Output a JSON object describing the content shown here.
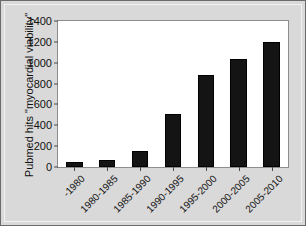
{
  "chart_data": {
    "type": "bar",
    "title": "",
    "xlabel": "",
    "ylabel": "Pubmed hits \"myocardial viability\"",
    "categories": [
      "-1980",
      "1980-1985",
      "1985-1990",
      "1990-1995",
      "1995-2000",
      "2000-2005",
      "2005-2010"
    ],
    "values": [
      50,
      70,
      150,
      510,
      880,
      1040,
      1200
    ],
    "ylim": [
      0,
      1400
    ],
    "ytick_labels": [
      "0",
      "200",
      "400",
      "600",
      "800",
      "1000",
      "1200",
      "1400"
    ],
    "ytick_values": [
      0,
      200,
      400,
      600,
      800,
      1000,
      1200,
      1400
    ],
    "grid": false,
    "legend": "none",
    "bar_color": "#141414",
    "plot_background": "#ffffff",
    "figure_background": "#d9d9d9",
    "axis_color": "#4a4a4a"
  }
}
